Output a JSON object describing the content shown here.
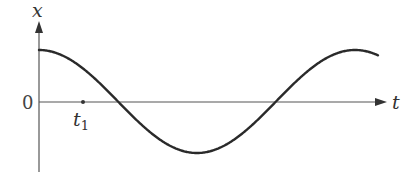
{
  "diagram": {
    "type": "displacement-time graph",
    "y_axis_label": "x",
    "x_axis_label": "t",
    "origin_label": "0",
    "marker_label": "t",
    "marker_subscript": "1",
    "curve": "cosine",
    "colors": {
      "axis": "#555555",
      "curve": "#2a2a2a",
      "text": "#333333"
    }
  }
}
